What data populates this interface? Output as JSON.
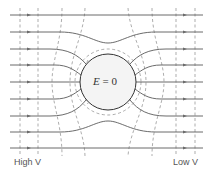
{
  "diagram": {
    "center_label_var": "E",
    "center_label_rest": " = 0",
    "left_label": "High V",
    "right_label": "Low V",
    "colors": {
      "field_line": "#5a5a5a",
      "equipotential": "#8a8a8a",
      "sphere_fill": "#f4f4f4",
      "sphere_stroke": "#333333",
      "arrow": "#6a6a6a"
    },
    "sphere": {
      "cx": 108,
      "cy": 82,
      "r": 28
    },
    "field_line_ys": [
      15,
      32,
      49,
      65,
      82,
      99,
      116,
      132,
      148
    ],
    "equipotential_xs_left": [
      20,
      38
    ],
    "equipotential_xs_right": [
      176,
      195
    ]
  }
}
